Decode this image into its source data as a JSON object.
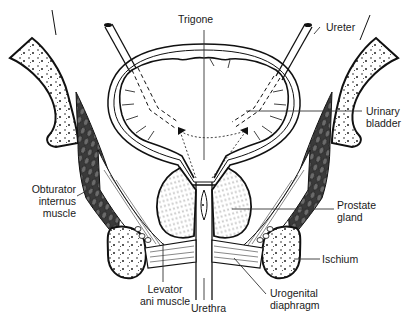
{
  "figure": {
    "labels": {
      "trigone": "Trigone",
      "ureter": "Ureter",
      "urinary_bladder": {
        "line1": "Urinary",
        "line2": "bladder"
      },
      "obturator_internus": {
        "line1": "Obturator",
        "line2": "internus",
        "line3": "muscle"
      },
      "prostate_gland": {
        "line1": "Prostate",
        "line2": "gland"
      },
      "ischium": "Ischium",
      "levator_ani": {
        "line1": "Levator",
        "line2": "ani muscle"
      },
      "urethra": "Urethra",
      "urogenital_diaphragm": {
        "line1": "Urogenital",
        "line2": "diaphragm"
      }
    }
  },
  "colors": {
    "ink": "#1a1a1a",
    "muscle_fill": "#3a3a3a",
    "background": "#ffffff",
    "prostate_stipple": "#555555"
  }
}
